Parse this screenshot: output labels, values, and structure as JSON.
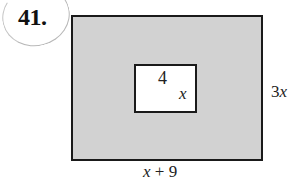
{
  "problem": {
    "number": "41."
  },
  "figure": {
    "outer_rectangle": {
      "width_label": "x + 9",
      "height_label": "3x",
      "fill": "#d2d2d2",
      "stroke": "#1a1a1a"
    },
    "inner_rectangle": {
      "width_label": "4",
      "height_label": "x",
      "fill": "#ffffff",
      "stroke": "#1a1a1a"
    }
  }
}
